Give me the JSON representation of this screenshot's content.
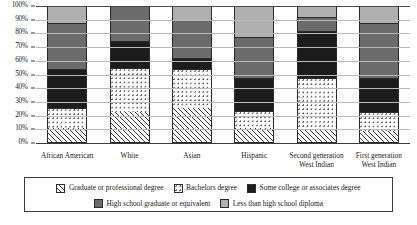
{
  "chart_data": {
    "type": "bar",
    "subtype": "stacked-bar-100-percent",
    "title": "",
    "xlabel": "",
    "ylabel": "",
    "ylim": [
      0,
      100
    ],
    "y_unit": "%",
    "grid": true,
    "legend_position": "bottom",
    "categories": [
      "African American",
      "White",
      "Asian",
      "Hispanic",
      "Second generation\nWest Indian",
      "First generation\nWest Indian"
    ],
    "y_ticks": [
      "0%",
      "10%",
      "20%",
      "30%",
      "40%",
      "50%",
      "60%",
      "70%",
      "80%",
      "90%",
      "100%"
    ],
    "y_tick_values": [
      0,
      10,
      20,
      30,
      40,
      50,
      60,
      70,
      80,
      90,
      100
    ],
    "series": [
      {
        "name": "Graduate or professional degree",
        "pattern": "diagonal-hatch",
        "color": "#ffffff",
        "values": [
          10,
          22,
          25,
          10,
          9,
          8
        ]
      },
      {
        "name": "Bachelors degree",
        "pattern": "dots",
        "color": "#ffffff",
        "values": [
          15,
          32,
          28,
          13,
          38,
          14
        ]
      },
      {
        "name": "Some college or associates degree",
        "pattern": "solid",
        "color": "#1c1c1c",
        "values": [
          28,
          20,
          8,
          24,
          34,
          25
        ]
      },
      {
        "name": "High school graduate or equivalent",
        "pattern": "solid",
        "color": "#6b6b6b",
        "values": [
          34,
          25,
          28,
          30,
          10,
          40
        ]
      },
      {
        "name": "Less than high school diploma",
        "pattern": "solid",
        "color": "#b0b0b0",
        "values": [
          13,
          1,
          11,
          23,
          9,
          13
        ]
      }
    ],
    "cumulative_tops": {
      "African American": [
        10,
        25,
        53,
        87,
        100
      ],
      "White": [
        22,
        54,
        74,
        99,
        100
      ],
      "Asian": [
        25,
        53,
        61,
        89,
        100
      ],
      "Hispanic": [
        10,
        23,
        47,
        77,
        100
      ],
      "Second generation West Indian": [
        9,
        47,
        81,
        91,
        100
      ],
      "First generation West Indian": [
        8,
        22,
        47,
        87,
        100
      ]
    },
    "annotations": []
  },
  "legend": {
    "items": [
      {
        "label": "Graduate or professional degree",
        "swatch": "hatch"
      },
      {
        "label": "Bachelors degree",
        "swatch": "dots"
      },
      {
        "label": "Some college or associates degree",
        "swatch": "black"
      },
      {
        "label": "High school graduate or equivalent",
        "swatch": "darkgray"
      },
      {
        "label": "Less than high school diploma",
        "swatch": "lightgray"
      }
    ]
  },
  "colors": {
    "axis": "#3a3a3a",
    "grid": "#b8b8b8",
    "background": "#ffffff",
    "black_segment": "#1c1c1c",
    "dark_gray_segment": "#6b6b6b",
    "light_gray_segment": "#b0b0b0"
  }
}
